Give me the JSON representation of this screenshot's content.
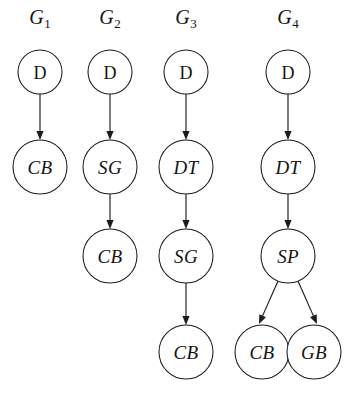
{
  "figure": {
    "type": "directed-acyclic-graph-set",
    "background_color": "#ffffff",
    "stroke_color": "#1b1b1b",
    "text_color": "#141414",
    "width": 359,
    "height": 395
  },
  "columns": [
    {
      "id": "G1",
      "label_base": "G",
      "label_sub": "1",
      "label_x": 40,
      "label_y": 24,
      "nodes": [
        {
          "id": "g1-d",
          "text": "D",
          "style": "roman",
          "cx": 40,
          "cy": 72,
          "r": 22
        },
        {
          "id": "g1-cb",
          "text": "CB",
          "style": "italic",
          "cx": 40,
          "cy": 167,
          "r": 27
        }
      ],
      "edges": [
        {
          "id": "g1-e1",
          "from": "g1-d",
          "to": "g1-cb",
          "x1": 40,
          "y1": 94,
          "x2": 40,
          "y2": 140
        }
      ]
    },
    {
      "id": "G2",
      "label_base": "G",
      "label_sub": "2",
      "label_x": 110,
      "label_y": 24,
      "nodes": [
        {
          "id": "g2-d",
          "text": "D",
          "style": "roman",
          "cx": 110,
          "cy": 72,
          "r": 22
        },
        {
          "id": "g2-sg",
          "text": "SG",
          "style": "italic",
          "cx": 110,
          "cy": 167,
          "r": 27
        },
        {
          "id": "g2-cb",
          "text": "CB",
          "style": "italic",
          "cx": 110,
          "cy": 256,
          "r": 27
        }
      ],
      "edges": [
        {
          "id": "g2-e1",
          "from": "g2-d",
          "to": "g2-sg",
          "x1": 110,
          "y1": 94,
          "x2": 110,
          "y2": 140
        },
        {
          "id": "g2-e2",
          "from": "g2-sg",
          "to": "g2-cb",
          "x1": 110,
          "y1": 194,
          "x2": 110,
          "y2": 229
        }
      ]
    },
    {
      "id": "G3",
      "label_base": "G",
      "label_sub": "3",
      "label_x": 186,
      "label_y": 24,
      "nodes": [
        {
          "id": "g3-d",
          "text": "D",
          "style": "roman",
          "cx": 186,
          "cy": 72,
          "r": 22
        },
        {
          "id": "g3-dt",
          "text": "DT",
          "style": "italic",
          "cx": 186,
          "cy": 167,
          "r": 27
        },
        {
          "id": "g3-sg",
          "text": "SG",
          "style": "italic",
          "cx": 186,
          "cy": 256,
          "r": 27
        },
        {
          "id": "g3-cb",
          "text": "CB",
          "style": "italic",
          "cx": 186,
          "cy": 352,
          "r": 27
        }
      ],
      "edges": [
        {
          "id": "g3-e1",
          "from": "g3-d",
          "to": "g3-dt",
          "x1": 186,
          "y1": 94,
          "x2": 186,
          "y2": 140
        },
        {
          "id": "g3-e2",
          "from": "g3-dt",
          "to": "g3-sg",
          "x1": 186,
          "y1": 194,
          "x2": 186,
          "y2": 229
        },
        {
          "id": "g3-e3",
          "from": "g3-sg",
          "to": "g3-cb",
          "x1": 186,
          "y1": 283,
          "x2": 186,
          "y2": 325
        }
      ]
    },
    {
      "id": "G4",
      "label_base": "G",
      "label_sub": "4",
      "label_x": 288,
      "label_y": 24,
      "nodes": [
        {
          "id": "g4-d",
          "text": "D",
          "style": "roman",
          "cx": 288,
          "cy": 72,
          "r": 22
        },
        {
          "id": "g4-dt",
          "text": "DT",
          "style": "italic",
          "cx": 288,
          "cy": 167,
          "r": 27
        },
        {
          "id": "g4-sp",
          "text": "SP",
          "style": "italic",
          "cx": 288,
          "cy": 256,
          "r": 27
        },
        {
          "id": "g4-cb",
          "text": "CB",
          "style": "italic",
          "cx": 262,
          "cy": 352,
          "r": 27
        },
        {
          "id": "g4-gb",
          "text": "GB",
          "style": "italic",
          "cx": 314,
          "cy": 352,
          "r": 27
        }
      ],
      "edges": [
        {
          "id": "g4-e1",
          "from": "g4-d",
          "to": "g4-dt",
          "x1": 288,
          "y1": 94,
          "x2": 288,
          "y2": 140
        },
        {
          "id": "g4-e2",
          "from": "g4-dt",
          "to": "g4-sp",
          "x1": 288,
          "y1": 194,
          "x2": 288,
          "y2": 229
        },
        {
          "id": "g4-e3",
          "from": "g4-sp",
          "to": "g4-cb",
          "x1": 278,
          "y1": 281,
          "x2": 259,
          "y2": 324
        },
        {
          "id": "g4-e4",
          "from": "g4-sp",
          "to": "g4-gb",
          "x1": 298,
          "y1": 281,
          "x2": 317,
          "y2": 324
        }
      ]
    }
  ]
}
